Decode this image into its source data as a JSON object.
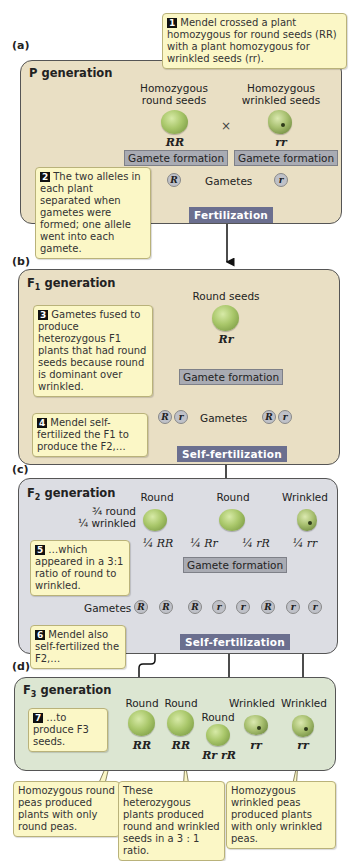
{
  "panels": {
    "a": {
      "label": "(a)",
      "title": "P generation"
    },
    "b": {
      "label": "(b)",
      "title_main": "F",
      "title_sub": "1",
      "title_rest": " generation"
    },
    "c": {
      "label": "(c)",
      "title_main": "F",
      "title_sub": "2",
      "title_rest": " generation"
    },
    "d": {
      "label": "(d)",
      "title_main": "F",
      "title_sub": "3",
      "title_rest": " generation"
    }
  },
  "p_generation": {
    "left_label": "Homozygous round seeds",
    "left_label_l1": "Homozygous",
    "left_label_l2": "round seeds",
    "right_label_l1": "Homozygous",
    "right_label_l2": "wrinkled seeds",
    "cross_symbol": "×",
    "left_genotype": "RR",
    "right_genotype": "rr",
    "gamete_formation": "Gamete formation",
    "gametes_label": "Gametes",
    "allele_left": "R",
    "allele_right": "r",
    "fertilization": "Fertilization"
  },
  "f1_generation": {
    "seed_label": "Round seeds",
    "genotype": "Rr",
    "gamete_formation": "Gamete formation",
    "gametes_label": "Gametes",
    "alleles": [
      "R",
      "r",
      "R",
      "r"
    ],
    "self_fertilization": "Self-fertilization"
  },
  "f2_generation": {
    "ratio_line1": "¾ round",
    "ratio_line2": "¼ wrinkled",
    "phenotypes": [
      "Round",
      "Round",
      "Wrinkled"
    ],
    "genotypes": [
      "¼ RR",
      "¼ Rr",
      "¼ rR",
      "¼ rr"
    ],
    "gamete_formation": "Gamete formation",
    "gametes_label": "Gametes",
    "alleles": [
      "R",
      "R",
      "R",
      "r",
      "r",
      "R",
      "r",
      "r"
    ],
    "self_fertilization": "Self-fertilization"
  },
  "f3_generation": {
    "phenotypes": [
      "Round",
      "Round",
      "Round",
      "Wrinkled",
      "Wrinkled"
    ],
    "genotypes": [
      "RR",
      "RR",
      "Rr rR",
      "rr",
      "rr"
    ]
  },
  "notes": [
    {
      "num": "1",
      "text": "Mendel crossed a plant homozygous for round seeds (RR) with a plant homozygous for wrinkled seeds (rr)."
    },
    {
      "num": "2",
      "text": "The two alleles in each plant separated when gametes were formed; one allele went into each gamete."
    },
    {
      "num": "3",
      "text": "Gametes fused to produce heterozygous F1 plants that had round seeds because round is dominant over wrinkled."
    },
    {
      "num": "4",
      "text": "Mendel self-fertilized the F1 to produce the F2,…"
    },
    {
      "num": "5",
      "text": "…which appeared in a 3:1 ratio of round to wrinkled."
    },
    {
      "num": "6",
      "text": "Mendel also self-fertilized the F2,…"
    },
    {
      "num": "7",
      "text": "…to produce F3 seeds."
    }
  ],
  "bottom_notes": [
    "Homozygous round peas produced plants with only round peas.",
    "These heterozygous plants produced round and wrinkled seeds in a 3 : 1 ratio.",
    "Homozygous wrinkled peas produced plants with only wrinkled peas."
  ],
  "colors": {
    "p_panel": "#e9dfc4",
    "f1_panel": "#e9dfc4",
    "f2_panel": "#dcdde3",
    "f3_panel": "#dce6d2",
    "note_bg": "#fbf7c6",
    "fert_box": "#6b6f8f",
    "gamete_box": "#a9abb3"
  }
}
